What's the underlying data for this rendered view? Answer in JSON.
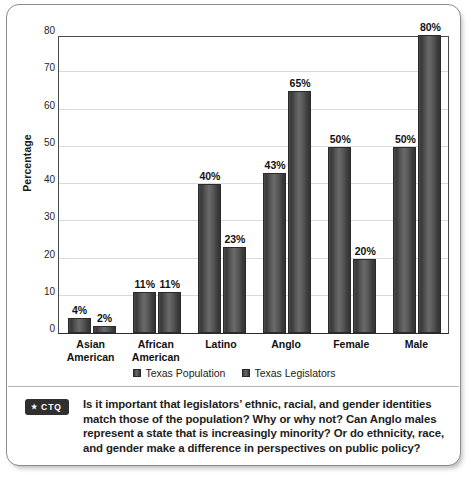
{
  "chart_data": {
    "type": "bar",
    "title": "",
    "xlabel": "",
    "ylabel": "Percentage",
    "ylim": [
      0,
      80
    ],
    "yticks": [
      0,
      10,
      20,
      30,
      40,
      50,
      60,
      70,
      80
    ],
    "ytick_labels": [
      "0",
      "10",
      "20",
      "30",
      "40",
      "50",
      "60",
      "70",
      "80"
    ],
    "grid": "horizontal",
    "legend_position": "bottom-center",
    "categories": [
      "Asian American",
      "African American",
      "Latino",
      "Anglo",
      "Female",
      "Male"
    ],
    "category_lines": [
      [
        "Asian",
        "American"
      ],
      [
        "African",
        "American"
      ],
      [
        "Latino",
        ""
      ],
      [
        "Anglo",
        ""
      ],
      [
        "Female",
        ""
      ],
      [
        "Male",
        ""
      ]
    ],
    "series": [
      {
        "name": "Texas Population",
        "values": [
          4,
          11,
          40,
          43,
          50,
          50
        ],
        "labels": [
          "4%",
          "11%",
          "40%",
          "43%",
          "50%",
          "50%"
        ]
      },
      {
        "name": "Texas Legislators",
        "values": [
          2,
          11,
          23,
          65,
          20,
          80
        ],
        "labels": [
          "2%",
          "11%",
          "23%",
          "65%",
          "20%",
          "80%"
        ]
      }
    ]
  },
  "caption": {
    "badge_star": "★",
    "badge_label": "CTQ",
    "text": "Is it important that legislators’ ethnic, racial, and gender identities match those of the population? Why or why not? Can Anglo males represent a state that is increasingly minority? Or do ethnicity, race, and gender make a difference in perspectives on public policy?"
  },
  "colors": {
    "bar_fill": "#4a4a4a",
    "gridline": "#d9d9d9",
    "axis": "#2b2b2b",
    "frame_border": "#8c8c8c",
    "badge_bg": "#2f2f2f",
    "text": "#1d1d1d"
  }
}
